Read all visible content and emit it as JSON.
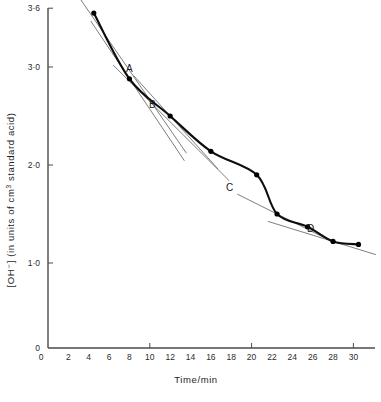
{
  "chart_data": {
    "type": "line",
    "title": "",
    "xlabel": "Time/min",
    "ylabel": "[OH⁻] (in units of cm³ standard acid)",
    "ylabel_parts": {
      "prefix": "[OH⁻] (in units of cm",
      "superscript": "3",
      "suffix": " standard acid)"
    },
    "xlim": [
      0,
      32
    ],
    "ylim": [
      0,
      3.6
    ],
    "grid": false,
    "legend": "none",
    "xticks": [
      0,
      2,
      4,
      6,
      8,
      10,
      12,
      14,
      16,
      18,
      20,
      22,
      24,
      26,
      28,
      30
    ],
    "xtick_labels": [
      "0",
      "2",
      "4",
      "6",
      "8",
      "10",
      "12",
      "14",
      "16",
      "18",
      "20",
      "22",
      "24",
      "26",
      "28",
      "30"
    ],
    "yticks": [
      0,
      1.0,
      2.0,
      3.0,
      3.6
    ],
    "ytick_labels": [
      "0",
      "1·0",
      "2·0",
      "3·0",
      "3·6"
    ],
    "x": [
      4.5,
      8.0,
      12.0,
      16.0,
      20.5,
      22.5,
      25.5,
      28.0,
      30.5
    ],
    "y": [
      3.55,
      2.88,
      2.5,
      2.14,
      1.9,
      1.5,
      1.37,
      1.22,
      1.19
    ],
    "series": [
      {
        "name": "[OH⁻] decay",
        "values": [
          3.55,
          2.88,
          2.5,
          2.14,
          1.9,
          1.5,
          1.37,
          1.22,
          1.19
        ]
      }
    ],
    "annotations": [
      {
        "label": "A",
        "x": 8.0,
        "y": 2.88,
        "tangent_slope": -0.155,
        "tangent_x0": 4.2,
        "tangent_x1": 13.4
      },
      {
        "label": "B",
        "x": 12.0,
        "y": 2.5,
        "tangent_slope": -0.115,
        "tangent_x0": 8.4,
        "tangent_x1": 16.7
      },
      {
        "label": "C",
        "x": 22.5,
        "y": 1.5,
        "tangent_slope": -0.052,
        "tangent_x0": 18.6,
        "tangent_x1": 27.1
      },
      {
        "label": "D",
        "x": 28.0,
        "y": 1.22,
        "tangent_slope": -0.032,
        "tangent_x0": 21.6,
        "tangent_x1": 32.2
      }
    ],
    "extra_tangents": [
      {
        "name": "initial-rate-tangent",
        "x0": 3.0,
        "y0": 3.72,
        "x1": 13.6,
        "y1": 2.12
      },
      {
        "name": "secondary-tangent",
        "x0": 6.4,
        "y0": 3.02,
        "x1": 17.8,
        "y1": 1.84
      }
    ]
  },
  "labels": {
    "point_a": "A",
    "point_b": "B",
    "point_c": "C",
    "point_d": "D"
  },
  "colors": {
    "curve": "#0d0d0d",
    "tangent": "#6f6f6f",
    "axis": "#4a4a4a",
    "text": "#1e1e1e",
    "background": "#ffffff"
  }
}
